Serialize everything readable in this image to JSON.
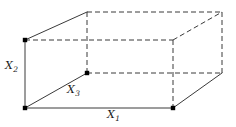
{
  "figure": {
    "kind": "3d-rectangular-box-diagram",
    "width": 236,
    "height": 127,
    "background_color": "#ffffff",
    "line_color": "#3a3a3a",
    "vertex_dot_color": "#000000",
    "solid_line_width": 1,
    "dashed_line_width": 1,
    "dash_pattern": "5,3"
  },
  "labels": {
    "x1": {
      "base": "X",
      "subscript": "1",
      "text": "X₁",
      "role": "length-edge-label"
    },
    "x2": {
      "base": "X",
      "subscript": "2",
      "text": "X₂",
      "role": "height-edge-label"
    },
    "x3": {
      "base": "X",
      "subscript": "3",
      "text": "X₃",
      "role": "depth-edge-label"
    }
  },
  "geometry": {
    "vertices": {
      "front_bottom_left": {
        "x": 25,
        "y": 108,
        "dot": true
      },
      "front_bottom_right": {
        "x": 173,
        "y": 108,
        "dot": true
      },
      "front_top_left": {
        "x": 25,
        "y": 40,
        "dot": true
      },
      "front_top_right": {
        "x": 173,
        "y": 40,
        "dot": false
      },
      "back_bottom_left": {
        "x": 87,
        "y": 73,
        "dot": true
      },
      "back_bottom_right": {
        "x": 222,
        "y": 73,
        "dot": false
      },
      "back_top_left": {
        "x": 87,
        "y": 12,
        "dot": false
      },
      "back_top_right": {
        "x": 222,
        "y": 12,
        "dot": false
      }
    },
    "solid_edges": [
      {
        "name": "bottom-front-edge-x1",
        "from": "front_bottom_left",
        "to": "front_bottom_right"
      },
      {
        "name": "left-vertical-edge-x2",
        "from": "front_bottom_left",
        "to": "front_top_left"
      },
      {
        "name": "depth-diagonal-edge-x3",
        "from": "front_bottom_left",
        "to": "back_bottom_left"
      },
      {
        "name": "back-bottom-edge",
        "from": "back_bottom_left",
        "to": "back_bottom_right"
      },
      {
        "name": "right-depth-diagonal-edge",
        "from": "front_bottom_right",
        "to": "back_bottom_right"
      },
      {
        "name": "top-left-depth-diagonal-edge",
        "from": "front_top_left",
        "to": "back_top_left"
      }
    ],
    "dashed_edges": [
      {
        "name": "top-front-edge",
        "from": "front_top_left",
        "to": "front_top_right"
      },
      {
        "name": "top-back-edge",
        "from": "back_top_left",
        "to": "back_top_right"
      },
      {
        "name": "right-front-vertical-edge",
        "from": "front_top_right",
        "to": "front_bottom_right"
      },
      {
        "name": "right-back-vertical-edge",
        "from": "back_top_right",
        "to": "back_bottom_right"
      },
      {
        "name": "middle-back-vertical-edge",
        "from": "back_top_left",
        "to": "back_bottom_left"
      },
      {
        "name": "middle-horizontal-back-edge",
        "from": "back_bottom_left",
        "to": "back_bottom_right"
      },
      {
        "name": "top-right-depth-diagonal-edge",
        "from": "front_top_right",
        "to": "back_top_right"
      },
      {
        "name": "back-left-hidden-edge",
        "from": "front_top_left",
        "to": "back_top_left"
      }
    ]
  }
}
